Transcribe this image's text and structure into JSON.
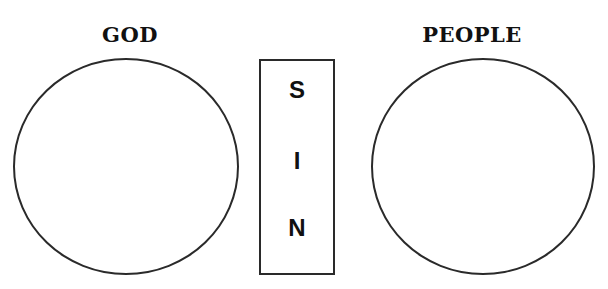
{
  "diagram": {
    "left": {
      "label": "GOD",
      "shape": "circle"
    },
    "separator": {
      "shape": "rectangle",
      "letters": [
        "S",
        "I",
        "N"
      ],
      "word": "SIN"
    },
    "right": {
      "label": "PEOPLE",
      "shape": "circle"
    },
    "colors": {
      "stroke": "#2a2a2a",
      "text": "#111111",
      "background": "#ffffff"
    }
  }
}
